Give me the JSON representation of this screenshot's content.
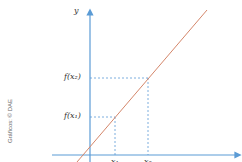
{
  "diagram": {
    "type": "function-graph",
    "y_axis_label": "y",
    "x_axis_label": "",
    "y_ticks": [
      "f(x₂)",
      "f(x₁)"
    ],
    "x_ticks": [
      "x₁",
      "x₂"
    ],
    "credit": "Gráficos: © DAE",
    "colors": {
      "axis": "#5b9bd5",
      "line": "#d4866a",
      "guide": "#5b9bd5"
    }
  }
}
